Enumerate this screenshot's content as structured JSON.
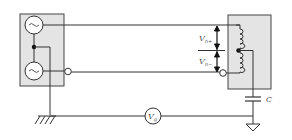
{
  "diagram": {
    "type": "circuit-schematic",
    "colors": {
      "line": "#333333",
      "box_fill": "#e4e4e4",
      "box_stroke": "#444444",
      "background": "#ffffff"
    },
    "left_source_box": {
      "sources": [
        {
          "symbol": "~",
          "icon": "ac-source-icon"
        },
        {
          "symbol": "~",
          "icon": "ac-source-icon"
        }
      ]
    },
    "labels": {
      "vn_plus_main": "V",
      "vn_plus_sub": "n+",
      "vn_minus_main": "V",
      "vn_minus_sub": "n−",
      "meter_main": "V",
      "meter_sub": "g",
      "capacitor": "C"
    }
  }
}
